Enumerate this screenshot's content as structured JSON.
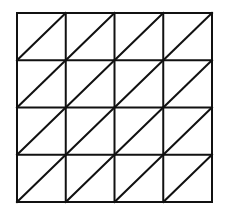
{
  "diagram": {
    "rows": 4,
    "cols": 4,
    "diagonal_direction": "bottom-left-to-top-right",
    "stroke_color": "#111111",
    "background_color": "#ffffff",
    "bounds": {
      "x": 17,
      "y": 13,
      "width": 195,
      "height": 189
    }
  }
}
